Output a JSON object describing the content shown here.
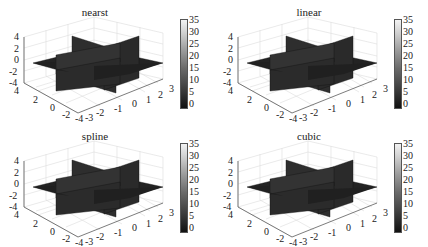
{
  "chart_data": [
    {
      "type": "volume-slice",
      "title": "nearst",
      "x_ticks": [
        "-3",
        "-2",
        "-1",
        "0",
        "1",
        "2",
        "3"
      ],
      "y_ticks": [
        "4",
        "2",
        "0",
        "-2",
        "-4"
      ],
      "z_ticks": [
        "4",
        "2",
        "0",
        "-2",
        "-4"
      ],
      "colorbar_ticks": [
        "35",
        "30",
        "25",
        "20",
        "15",
        "10",
        "5",
        "0"
      ],
      "colorbar_range": [
        0,
        35
      ],
      "slices": [
        "x=0",
        "y=0",
        "z=0"
      ],
      "grid": true
    },
    {
      "type": "volume-slice",
      "title": "linear",
      "x_ticks": [
        "-3",
        "-2",
        "-1",
        "0",
        "1",
        "2",
        "3"
      ],
      "y_ticks": [
        "4",
        "2",
        "0",
        "-2",
        "-4"
      ],
      "z_ticks": [
        "4",
        "2",
        "0",
        "-2",
        "-4"
      ],
      "colorbar_ticks": [
        "35",
        "30",
        "25",
        "20",
        "15",
        "10",
        "5",
        "0"
      ],
      "colorbar_range": [
        0,
        35
      ],
      "slices": [
        "x=0",
        "y=0",
        "z=0"
      ],
      "grid": true
    },
    {
      "type": "volume-slice",
      "title": "spline",
      "x_ticks": [
        "-3",
        "-2",
        "-1",
        "0",
        "1",
        "2",
        "3"
      ],
      "y_ticks": [
        "4",
        "2",
        "0",
        "-2",
        "-4"
      ],
      "z_ticks": [
        "4",
        "2",
        "0",
        "-2",
        "-4"
      ],
      "colorbar_ticks": [
        "35",
        "30",
        "25",
        "20",
        "15",
        "10",
        "5",
        "0"
      ],
      "colorbar_range": [
        0,
        35
      ],
      "slices": [
        "x=0",
        "y=0",
        "z=0"
      ],
      "grid": true
    },
    {
      "type": "volume-slice",
      "title": "cubic",
      "x_ticks": [
        "-3",
        "-2",
        "-1",
        "0",
        "1",
        "2",
        "3"
      ],
      "y_ticks": [
        "4",
        "2",
        "0",
        "-2",
        "-4"
      ],
      "z_ticks": [
        "4",
        "2",
        "0",
        "-2",
        "-4"
      ],
      "colorbar_ticks": [
        "35",
        "30",
        "25",
        "20",
        "15",
        "10",
        "5",
        "0"
      ],
      "colorbar_range": [
        0,
        35
      ],
      "slices": [
        "x=0",
        "y=0",
        "z=0"
      ],
      "grid": true
    }
  ]
}
